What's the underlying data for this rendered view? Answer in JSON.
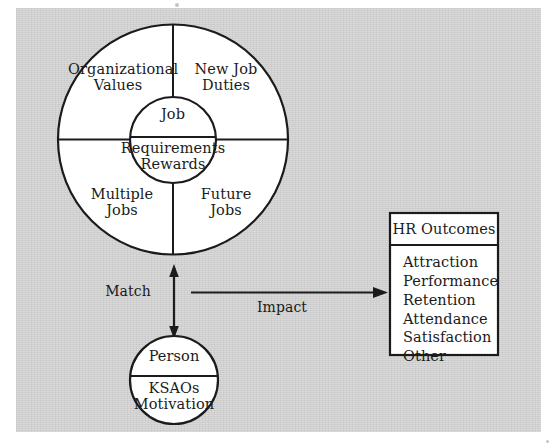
{
  "figure": {
    "background_color": "#cfcfcf",
    "page_color": "#ffffff",
    "ink_color": "#1b1b1b"
  },
  "job_circle": {
    "quadrants": [
      {
        "id": "organizational-values",
        "line1": "Organizational",
        "line2": "Values"
      },
      {
        "id": "new-job-duties",
        "line1": "New Job",
        "line2": "Duties"
      },
      {
        "id": "multiple-jobs",
        "line1": "Multiple",
        "line2": "Jobs"
      },
      {
        "id": "future-jobs",
        "line1": "Future",
        "line2": "Jobs"
      }
    ],
    "core": {
      "top": "Job",
      "bottom_line1": "Requirements",
      "bottom_line2": "Rewards"
    }
  },
  "person_circle": {
    "top": "Person",
    "bottom_line1": "KSAOs",
    "bottom_line2": "Motivation"
  },
  "connectors": {
    "match_label": "Match",
    "impact_label": "Impact"
  },
  "hr_outcomes_box": {
    "title": "HR Outcomes",
    "items": [
      "Attraction",
      "Performance",
      "Retention",
      "Attendance",
      "Satisfaction",
      "Other"
    ]
  }
}
